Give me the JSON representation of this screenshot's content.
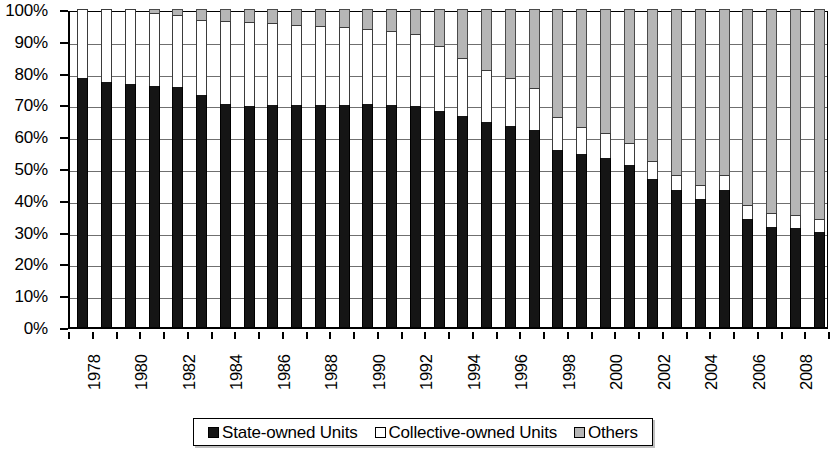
{
  "chart_data": {
    "type": "bar",
    "stacked": true,
    "title": "",
    "subtitle": "",
    "xlabel": "",
    "ylabel": "",
    "ylim": [
      0,
      100
    ],
    "y_unit": "%",
    "grid": true,
    "legend_position": "bottom",
    "y_tick_labels": [
      "0%",
      "10%",
      "20%",
      "30%",
      "40%",
      "50%",
      "60%",
      "70%",
      "80%",
      "90%",
      "100%"
    ],
    "y_tick_values": [
      0,
      10,
      20,
      30,
      40,
      50,
      60,
      70,
      80,
      90,
      100
    ],
    "categories": [
      "1978",
      "1979",
      "1980",
      "1981",
      "1982",
      "1983",
      "1984",
      "1985",
      "1986",
      "1987",
      "1988",
      "1989",
      "1990",
      "1991",
      "1992",
      "1993",
      "1994",
      "1995",
      "1996",
      "1997",
      "1998",
      "1999",
      "2000",
      "2001",
      "2002",
      "2003",
      "2004",
      "2005",
      "2006",
      "2007",
      "2008",
      "2009"
    ],
    "x_tick_labels": [
      "1978",
      "1980",
      "1982",
      "1984",
      "1986",
      "1988",
      "1990",
      "1992",
      "1994",
      "1996",
      "1998",
      "2000",
      "2002",
      "2004",
      "2006",
      "2008"
    ],
    "series": [
      {
        "name": "State-owned Units",
        "color": "#151515",
        "values": [
          78.3,
          77.0,
          76.5,
          75.8,
          75.4,
          73.0,
          70.0,
          69.5,
          69.7,
          69.8,
          69.8,
          69.8,
          70.0,
          69.7,
          69.5,
          68.0,
          66.3,
          64.5,
          63.3,
          61.8,
          55.8,
          54.3,
          53.3,
          51.0,
          46.7,
          43.0,
          40.3,
          43.0,
          34.0,
          31.5,
          31.0,
          30.0
        ]
      },
      {
        "name": "Collective-owned Units",
        "color": "#ffffff",
        "values": [
          21.7,
          23.0,
          23.5,
          22.9,
          22.6,
          23.7,
          26.2,
          26.5,
          26.0,
          25.3,
          24.8,
          24.4,
          23.7,
          23.3,
          22.6,
          20.4,
          18.4,
          16.4,
          14.9,
          13.4,
          10.2,
          8.6,
          7.8,
          6.8,
          5.5,
          4.9,
          4.4,
          4.7,
          4.5,
          4.3,
          4.1,
          4.0
        ]
      },
      {
        "name": "Others",
        "color": "#b6b6b6",
        "values": [
          0.0,
          0.0,
          0.0,
          1.3,
          2.0,
          3.3,
          3.8,
          4.0,
          4.3,
          4.9,
          5.4,
          5.8,
          6.3,
          7.0,
          7.9,
          11.6,
          15.3,
          19.1,
          21.8,
          24.8,
          34.0,
          37.1,
          38.9,
          42.2,
          47.8,
          52.1,
          55.3,
          52.3,
          61.5,
          64.2,
          64.9,
          66.0
        ]
      }
    ]
  },
  "legend": {
    "items": [
      {
        "label": "State-owned Units",
        "swatch": "#151515",
        "icon": "square-filled-black-icon"
      },
      {
        "label": "Collective-owned Units",
        "swatch": "#ffffff",
        "icon": "square-outline-white-icon"
      },
      {
        "label": "Others",
        "swatch": "#b6b6b6",
        "icon": "square-filled-gray-icon"
      }
    ]
  }
}
